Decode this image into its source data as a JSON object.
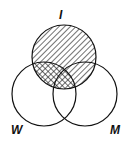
{
  "diagram": {
    "type": "venn",
    "sets": [
      {
        "label": "I",
        "cx": 64,
        "cy": 57,
        "r": 32
      },
      {
        "label": "W",
        "cx": 44,
        "cy": 94,
        "r": 32
      },
      {
        "label": "M",
        "cx": 85,
        "cy": 94,
        "r": 32
      }
    ],
    "shading": [
      {
        "region": "I only and I∩M",
        "pattern": "diagonal-hatch"
      },
      {
        "region": "I∩W",
        "pattern": "cross-hatch"
      }
    ],
    "colors": {
      "stroke": "#111111",
      "background": "#ffffff"
    }
  },
  "labels": {
    "I": "I",
    "W": "W",
    "M": "M"
  }
}
